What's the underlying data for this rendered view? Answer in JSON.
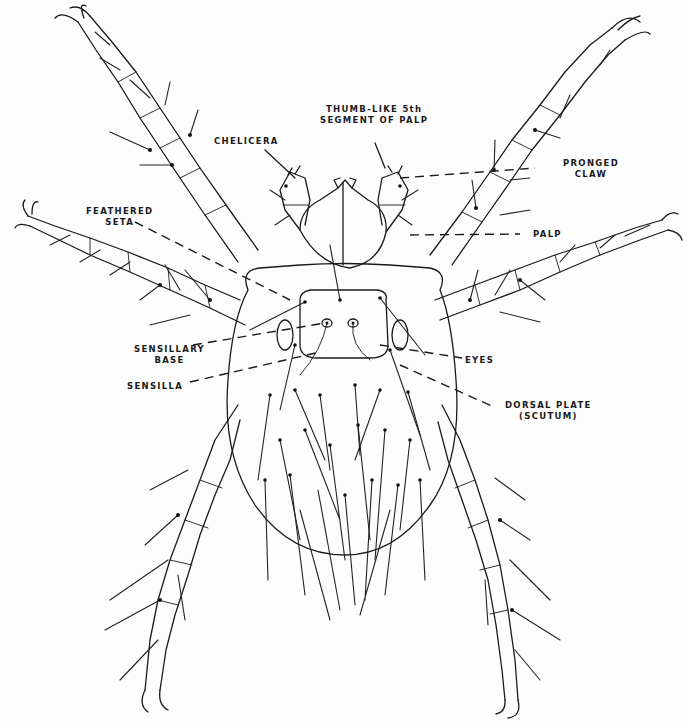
{
  "diagram": {
    "labels": [
      {
        "id": "thumb_like",
        "line1": "THUMB-LIKE 5th",
        "line2": "SEGMENT OF PALP"
      },
      {
        "id": "chelicera",
        "line1": "CHELICERA",
        "line2": ""
      },
      {
        "id": "pronged_claw",
        "line1": "PRONGED",
        "line2": "CLAW"
      },
      {
        "id": "feathered_seta",
        "line1": "FEATHERED",
        "line2": "SETA"
      },
      {
        "id": "palp",
        "line1": "PALP",
        "line2": ""
      },
      {
        "id": "sensillary_base",
        "line1": "SENSILLARY",
        "line2": "BASE"
      },
      {
        "id": "sensilla",
        "line1": "SENSILLA",
        "line2": ""
      },
      {
        "id": "eyes",
        "line1": "EYES",
        "line2": ""
      },
      {
        "id": "dorsal_plate",
        "line1": "DORSAL PLATE",
        "line2": "(SCUTUM)"
      }
    ]
  }
}
